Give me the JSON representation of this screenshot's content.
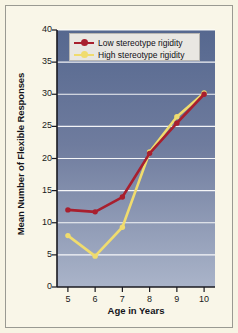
{
  "figure": {
    "background_color": "#f9f6e8",
    "border_color": "#9a9a92"
  },
  "chart_data": {
    "type": "line",
    "title": "",
    "xlabel": "Age in Years",
    "ylabel": "Mean Number of Flexible Responses",
    "x": [
      5,
      6,
      7,
      8,
      9,
      10
    ],
    "xtick_labels": [
      "5",
      "6",
      "7",
      "8",
      "9",
      "10"
    ],
    "ytick_labels": [
      "0",
      "5",
      "10",
      "15",
      "20",
      "25",
      "30",
      "35",
      "40"
    ],
    "yticks": [
      0,
      5,
      10,
      15,
      20,
      25,
      30,
      35,
      40
    ],
    "xlim": [
      4.6,
      10.4
    ],
    "ylim": [
      0,
      40
    ],
    "grid": "horizontal",
    "legend_position": "upper-left-inside",
    "plot_background": "blue-gray-vertical-gradient",
    "series": [
      {
        "name": "Low stereotype rigidity",
        "color": "#a81f2e",
        "marker": "circle",
        "values": [
          12.0,
          11.7,
          14.0,
          20.8,
          25.5,
          30.0
        ]
      },
      {
        "name": "High stereotype rigidity",
        "color": "#f0dc6e",
        "marker": "circle",
        "values": [
          8.0,
          4.8,
          9.3,
          21.0,
          26.5,
          30.2
        ]
      }
    ]
  },
  "legend": {
    "entries": [
      {
        "label": "Low stereotype rigidity",
        "color": "#a81f2e"
      },
      {
        "label": "High stereotype rigidity",
        "color": "#f0dc6e"
      }
    ]
  },
  "colors": {
    "low_rigidity": "#a81f2e",
    "high_rigidity": "#f0dc6e",
    "plot_top": "#5d6f96",
    "plot_bottom": "#a9b3c8",
    "gridline": "#ffffff",
    "axis": "#1a1a20",
    "page_background": "#f9f6e8"
  }
}
